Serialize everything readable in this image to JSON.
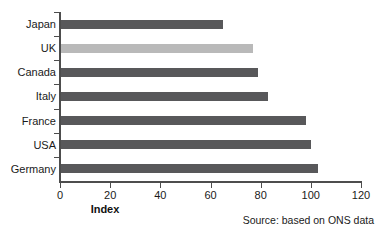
{
  "chart_data": {
    "type": "bar",
    "orientation": "horizontal",
    "title": "",
    "xlabel": "Index",
    "ylabel": "",
    "xlim": [
      0,
      120
    ],
    "xticks": [
      0,
      20,
      40,
      60,
      80,
      100,
      120
    ],
    "grid": false,
    "legend": "none",
    "categories": [
      "Japan",
      "UK",
      "Canada",
      "Italy",
      "France",
      "USA",
      "Germany"
    ],
    "values": [
      65,
      77,
      79,
      83,
      98,
      100,
      103
    ],
    "bar_colors": [
      "#58585a",
      "#b9b9b9",
      "#58585a",
      "#58585a",
      "#58585a",
      "#58585a",
      "#58585a"
    ],
    "highlighted_category": "UK",
    "annotation": "Source: based on ONS data"
  },
  "figure": {
    "axis_title": "Index",
    "source_note": "Source: based on ONS data",
    "default_bar_color": "#58585a",
    "highlight_bar_color": "#b9b9b9",
    "axis_color": "#4d4d4d",
    "background": "#ffffff"
  }
}
